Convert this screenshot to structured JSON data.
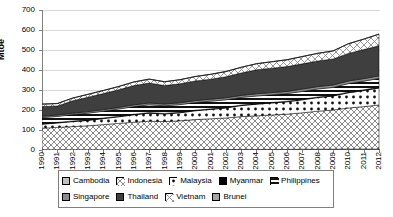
{
  "chart_data": {
    "type": "area",
    "title": "",
    "subtitle": "",
    "xlabel": "",
    "ylabel": "Mtoe",
    "ylim": [
      0,
      700
    ],
    "ytick_step": 100,
    "yticks": [
      "0",
      "100",
      "200",
      "300",
      "400",
      "500",
      "600",
      "700"
    ],
    "grid": true,
    "stacked": true,
    "legend_position": "bottom",
    "categories": [
      "1990",
      "1991",
      "1992",
      "1993",
      "1994",
      "1995",
      "1996",
      "1997",
      "1998",
      "1999",
      "2000",
      "2001",
      "2002",
      "2003",
      "2004",
      "2005",
      "2006",
      "2007",
      "2008",
      "2009",
      "2010",
      "2011",
      "2012"
    ],
    "series": [
      {
        "name": "Cambodia",
        "pattern": "solid-light-gray",
        "color": "#bfbfbf",
        "values": [
          1,
          1,
          1,
          1,
          1,
          1,
          1,
          2,
          2,
          2,
          2,
          2,
          2,
          3,
          3,
          3,
          3,
          4,
          4,
          4,
          5,
          5,
          5
        ]
      },
      {
        "name": "Indonesia",
        "pattern": "diagonal-crosshatch",
        "color": "#e8e8e8",
        "values": [
          108,
          112,
          116,
          120,
          126,
          132,
          138,
          142,
          140,
          144,
          150,
          154,
          158,
          164,
          168,
          172,
          176,
          182,
          190,
          196,
          205,
          212,
          220
        ]
      },
      {
        "name": "Malaysia",
        "pattern": "dotted",
        "color": "#ffffff",
        "values": [
          20,
          22,
          25,
          27,
          30,
          33,
          37,
          40,
          38,
          40,
          44,
          47,
          50,
          55,
          58,
          60,
          62,
          65,
          68,
          70,
          76,
          80,
          85
        ]
      },
      {
        "name": "Myanmar",
        "pattern": "solid-black",
        "color": "#000000",
        "values": [
          3,
          3,
          3,
          3,
          3,
          3,
          3,
          3,
          3,
          3,
          3,
          3,
          3,
          3,
          3,
          3,
          3,
          3,
          3,
          3,
          4,
          4,
          4
        ]
      },
      {
        "name": "Philippines",
        "pattern": "horizontal-stripes",
        "color": "#ffffff",
        "values": [
          30,
          30,
          32,
          33,
          34,
          36,
          38,
          39,
          38,
          38,
          38,
          38,
          38,
          38,
          38,
          38,
          38,
          39,
          40,
          40,
          42,
          43,
          44
        ]
      },
      {
        "name": "Singapore",
        "pattern": "solid-medium-gray",
        "color": "#8c8c8c",
        "values": [
          7,
          7,
          7,
          8,
          8,
          8,
          9,
          9,
          9,
          9,
          10,
          10,
          10,
          10,
          11,
          11,
          11,
          12,
          12,
          12,
          13,
          13,
          13
        ]
      },
      {
        "name": "Thailand",
        "pattern": "solid-dark-gray",
        "color": "#3f3f3f",
        "values": [
          48,
          45,
          62,
          72,
          80,
          88,
          96,
          100,
          92,
          95,
          98,
          100,
          105,
          112,
          120,
          122,
          124,
          126,
          128,
          130,
          138,
          145,
          150
        ]
      },
      {
        "name": "Vietnam",
        "pattern": "light-crosshatch",
        "color": "#f2f2f2",
        "values": [
          12,
          12,
          13,
          14,
          15,
          16,
          18,
          19,
          19,
          20,
          22,
          24,
          26,
          28,
          30,
          32,
          34,
          36,
          38,
          40,
          48,
          52,
          58
        ]
      },
      {
        "name": "Brunei",
        "pattern": "solid-gray",
        "color": "#a6a6a6",
        "values": [
          1,
          1,
          1,
          1,
          1,
          1,
          1,
          1,
          1,
          1,
          1,
          1,
          1,
          1,
          1,
          1,
          1,
          1,
          1,
          1,
          1,
          1,
          1
        ]
      }
    ],
    "totals": [
      230,
      198,
      236,
      265,
      278,
      295,
      310,
      340,
      335,
      345,
      360,
      378,
      393,
      410,
      432,
      441,
      452,
      465,
      484,
      495,
      532,
      555,
      580
    ],
    "annotations": []
  },
  "legend": {
    "row1": [
      {
        "label": "Cambodia",
        "icon": "legend-swatch-icon"
      },
      {
        "label": "Indonesia",
        "icon": "legend-swatch-icon"
      },
      {
        "label": "Malaysia",
        "icon": "legend-swatch-icon"
      },
      {
        "label": "Myanmar",
        "icon": "legend-swatch-icon"
      },
      {
        "label": "Philippines",
        "icon": "legend-swatch-icon"
      }
    ],
    "row2": [
      {
        "label": "Singapore",
        "icon": "legend-swatch-icon"
      },
      {
        "label": "Thailand",
        "icon": "legend-swatch-icon"
      },
      {
        "label": "Vietnam",
        "icon": "legend-swatch-icon"
      },
      {
        "label": "Brunei",
        "icon": "legend-swatch-icon"
      }
    ]
  },
  "axes": {
    "y_title": "Mtoe"
  },
  "colors": {
    "axis": "#808080",
    "grid": "#d9d9d9",
    "text": "#000000",
    "background": "#ffffff"
  }
}
